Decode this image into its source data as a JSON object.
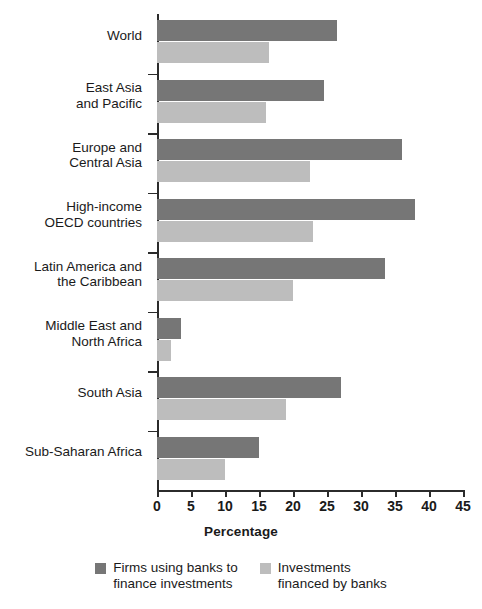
{
  "chart_data": {
    "type": "bar",
    "orientation": "horizontal",
    "title": "",
    "xlabel": "Percentage",
    "ylabel": "",
    "xlim": [
      0,
      45
    ],
    "xticks": [
      0,
      5,
      10,
      15,
      20,
      25,
      30,
      35,
      40,
      45
    ],
    "grid": false,
    "legend_position": "bottom",
    "categories": [
      "World",
      "East Asia\nand Pacific",
      "Europe and\nCentral Asia",
      "High-income\nOECD countries",
      "Latin America and\nthe Caribbean",
      "Middle East and\nNorth Africa",
      "South Asia",
      "Sub-Saharan Africa"
    ],
    "series": [
      {
        "name": "Firms using banks to\nfinance investments",
        "color": "#767676",
        "values": [
          26.5,
          24.5,
          36.0,
          38.0,
          33.5,
          3.5,
          27.0,
          15.0
        ]
      },
      {
        "name": "Investments\nfinanced by banks",
        "color": "#bdbdbd",
        "values": [
          16.5,
          16.0,
          22.5,
          23.0,
          20.0,
          2.0,
          19.0,
          10.0
        ]
      }
    ]
  },
  "axis": {
    "x_title": "Percentage",
    "tick_labels": [
      "0",
      "5",
      "10",
      "15",
      "20",
      "25",
      "30",
      "35",
      "40",
      "45"
    ]
  },
  "legend": {
    "items": [
      {
        "label": "Firms using banks to\nfinance investments",
        "color": "#767676"
      },
      {
        "label": "Investments\nfinanced by banks",
        "color": "#bdbdbd"
      }
    ]
  }
}
